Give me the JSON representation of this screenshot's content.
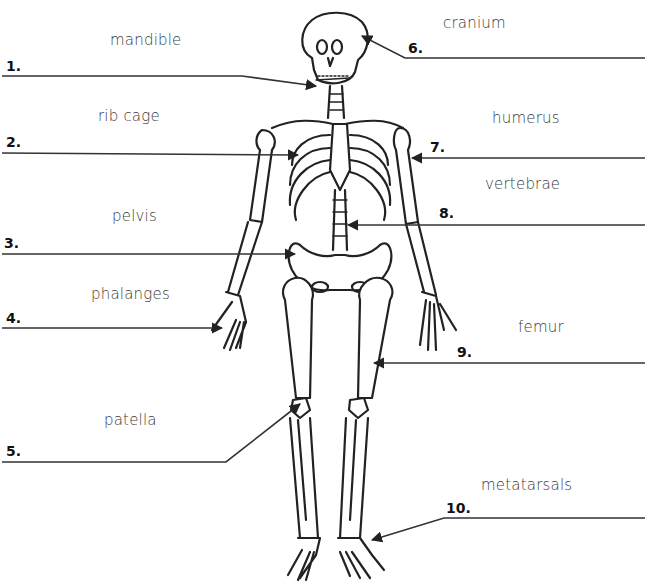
{
  "diagram": {
    "left_labels": [
      {
        "number": "1.",
        "word": "mandible"
      },
      {
        "number": "2.",
        "word": "rib cage"
      },
      {
        "number": "3.",
        "word": "pelvis"
      },
      {
        "number": "4.",
        "word": "phalanges"
      },
      {
        "number": "5.",
        "word": "patella"
      }
    ],
    "right_labels": [
      {
        "number": "6.",
        "word": "cranium"
      },
      {
        "number": "7.",
        "word": "humerus"
      },
      {
        "number": "8.",
        "word": "vertebrae"
      },
      {
        "number": "9.",
        "word": "femur"
      },
      {
        "number": "10.",
        "word": "metatarsals"
      }
    ],
    "line_color": "#222222",
    "text_color": "#3a3a3a"
  }
}
